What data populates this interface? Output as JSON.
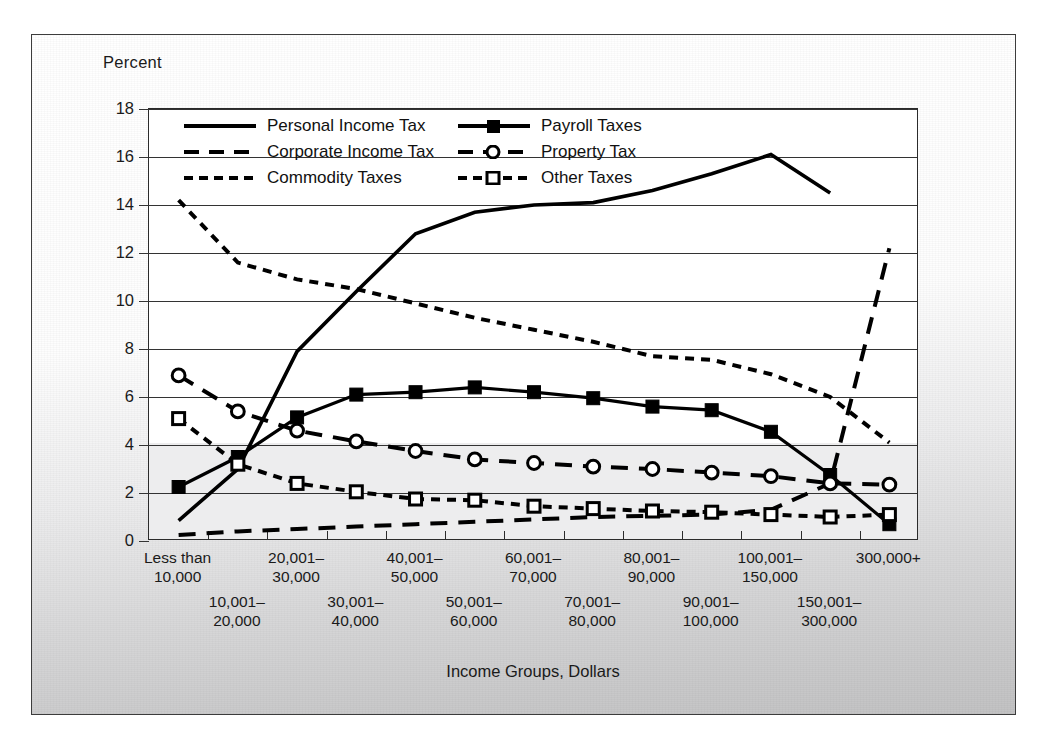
{
  "figure": {
    "y_axis_title": "Percent",
    "x_axis_title": "Income Groups, Dollars"
  },
  "axis": {
    "y_ticks": [
      "18",
      "16",
      "14",
      "12",
      "10",
      "8",
      "6",
      "4",
      "2",
      "0"
    ],
    "x_tick_labels": [
      {
        "line1": "Less than",
        "line2": "10,000",
        "row": "top"
      },
      {
        "line1": "10,001–",
        "line2": "20,000",
        "row": "bottom"
      },
      {
        "line1": "20,001–",
        "line2": "30,000",
        "row": "top"
      },
      {
        "line1": "30,001–",
        "line2": "40,000",
        "row": "bottom"
      },
      {
        "line1": "40,001–",
        "line2": "50,000",
        "row": "top"
      },
      {
        "line1": "50,001–",
        "line2": "60,000",
        "row": "bottom"
      },
      {
        "line1": "60,001–",
        "line2": "70,000",
        "row": "top"
      },
      {
        "line1": "70,001–",
        "line2": "80,000",
        "row": "bottom"
      },
      {
        "line1": "80,001–",
        "line2": "90,000",
        "row": "top"
      },
      {
        "line1": "90,001–",
        "line2": "100,000",
        "row": "bottom"
      },
      {
        "line1": "100,001–",
        "line2": "150,000",
        "row": "top"
      },
      {
        "line1": "150,001–",
        "line2": "300,000",
        "row": "bottom"
      },
      {
        "line1": "300,000+",
        "line2": "",
        "row": "top"
      }
    ]
  },
  "legend": {
    "items": [
      {
        "label": "Personal Income Tax",
        "key": "solid-line",
        "column": "left"
      },
      {
        "label": "Payroll Taxes",
        "key": "solid-line-filled-square-marker",
        "column": "right"
      },
      {
        "label": "Corporate Income Tax",
        "key": "long-dashed-line",
        "column": "left"
      },
      {
        "label": "Property Tax",
        "key": "long-dashed-line-open-circle-marker",
        "column": "right"
      },
      {
        "label": "Commodity Taxes",
        "key": "short-dashed-line",
        "column": "left"
      },
      {
        "label": "Other Taxes",
        "key": "short-dashed-line-open-square-marker",
        "column": "right"
      }
    ]
  },
  "chart_data": {
    "type": "line",
    "title": "",
    "xlabel": "Income Groups, Dollars",
    "ylabel": "Percent",
    "ylim": [
      0,
      18
    ],
    "ytick_step": 2,
    "grid": true,
    "legend_position": "top-left-inside",
    "line_color": "#000000",
    "categories": [
      "Less than 10,000",
      "10,001–20,000",
      "20,001–30,000",
      "30,001–40,000",
      "40,001–50,000",
      "50,001–60,000",
      "60,001–70,000",
      "70,001–80,000",
      "80,001–90,000",
      "90,001–100,000",
      "100,001–150,000",
      "150,001–300,000",
      "300,000+"
    ],
    "series": [
      {
        "name": "Personal Income Tax",
        "style": "solid",
        "marker": "none",
        "values": [
          0.85,
          3.0,
          7.9,
          10.4,
          12.8,
          13.7,
          14.0,
          14.1,
          14.6,
          15.3,
          16.1,
          14.5,
          null
        ]
      },
      {
        "name": "Payroll Taxes",
        "style": "solid",
        "marker": "filled-square",
        "values": [
          2.25,
          3.5,
          5.15,
          6.1,
          6.2,
          6.4,
          6.2,
          5.95,
          5.6,
          5.45,
          4.55,
          2.75,
          0.7
        ]
      },
      {
        "name": "Corporate Income Tax",
        "style": "long-dash",
        "marker": "none",
        "values": [
          0.25,
          0.4,
          0.5,
          0.6,
          0.7,
          0.8,
          0.9,
          1.0,
          1.05,
          1.1,
          1.3,
          2.4,
          12.2
        ]
      },
      {
        "name": "Property Tax",
        "style": "long-dash",
        "marker": "open-circle",
        "values": [
          6.9,
          5.4,
          4.6,
          4.15,
          3.75,
          3.4,
          3.25,
          3.1,
          3.0,
          2.85,
          2.7,
          2.4,
          2.35
        ]
      },
      {
        "name": "Commodity Taxes",
        "style": "short-dash",
        "marker": "none",
        "values": [
          14.2,
          11.6,
          10.9,
          10.5,
          9.9,
          9.3,
          8.8,
          8.3,
          7.7,
          7.55,
          6.95,
          6.0,
          4.1
        ]
      },
      {
        "name": "Other Taxes",
        "style": "short-dash",
        "marker": "open-square",
        "values": [
          5.1,
          3.2,
          2.4,
          2.05,
          1.75,
          1.7,
          1.45,
          1.35,
          1.25,
          1.2,
          1.1,
          1.0,
          1.1
        ]
      }
    ]
  }
}
